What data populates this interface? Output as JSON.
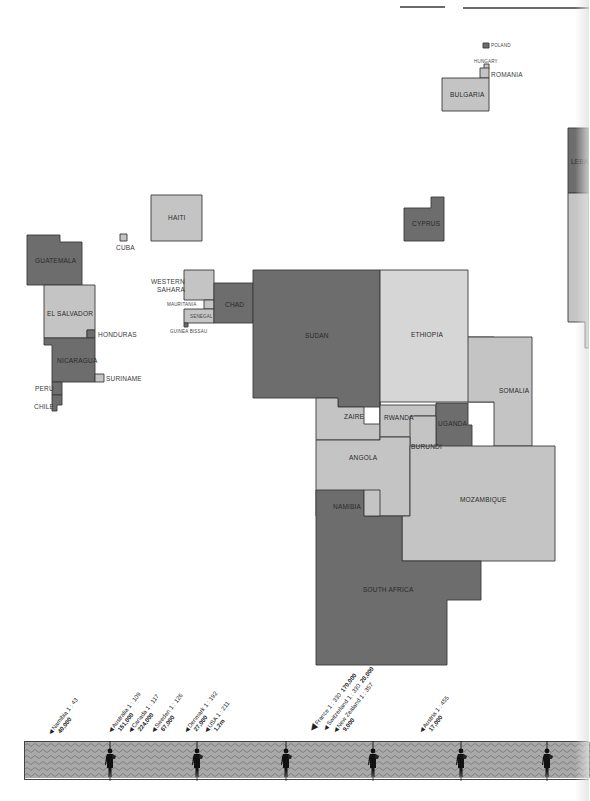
{
  "colors": {
    "dark": "#6d6d6d",
    "light": "#c4c4c4",
    "lighter": "#d6d6d6",
    "outline": "#3a3a3a",
    "band_fill": "#a9a9a9",
    "band_wave": "#7d7d7d"
  },
  "countries": [
    {
      "name": "POLAND",
      "tone": "dark",
      "points": "483,43 489,43 489,48 483,48"
    },
    {
      "name": "HUNGARY",
      "tone": "light",
      "points": "484,64 489,64 489,69 484,69"
    },
    {
      "name": "ROMANIA",
      "tone": "light",
      "points": "480,68 489,68 489,78 480,78"
    },
    {
      "name": "BULGARIA",
      "tone": "light",
      "points": "442,78 489,78 489,111 442,111"
    },
    {
      "name": "LEBANON",
      "tone": "dark",
      "points": "568,128 589,128 589,193 568,193"
    },
    {
      "name": "ISRAEL",
      "tone": "light",
      "points": "568,193 589,193 589,348 585,348 585,322 568,322"
    },
    {
      "name": "CYPRUS",
      "tone": "dark",
      "points": "404,208 431,208 431,197 444,197 444,241 404,241"
    },
    {
      "name": "HAITI",
      "tone": "light",
      "points": "151,195 202,195 202,241 151,241"
    },
    {
      "name": "CUBA",
      "tone": "light",
      "points": "120,234 127,234 127,241 120,241"
    },
    {
      "name": "GUATEMALA",
      "tone": "dark",
      "points": "27,235 60,235 60,242 82,242 82,285 27,285"
    },
    {
      "name": "EL SALVADOR",
      "tone": "light",
      "points": "44,285 95,285 95,330 87,330 87,338 44,338"
    },
    {
      "name": "HONDURAS",
      "tone": "dark",
      "points": "87,330 95,330 95,338 87,338"
    },
    {
      "name": "NICARAGUA",
      "tone": "dark",
      "points": "44,338 95,338 95,382 52,382 52,345 44,345"
    },
    {
      "name": "SURINAME",
      "tone": "light",
      "points": "95,374 104,374 104,382 95,382"
    },
    {
      "name": "PERU",
      "tone": "dark",
      "points": "52,382 62,382 62,395 52,395"
    },
    {
      "name": "CHILE",
      "tone": "dark",
      "points": "52,395 62,395 62,405 57,405 57,411 52,411"
    },
    {
      "name": "WESTERN SAHARA",
      "tone": "light",
      "points": "184,270 214,270 214,300 184,300"
    },
    {
      "name": "MAURITANIA",
      "tone": "light",
      "points": "204,300 214,300 214,309 204,309"
    },
    {
      "name": "SENEGAL",
      "tone": "light",
      "points": "184,309 214,309 214,323 184,323"
    },
    {
      "name": "GUINEA BISSAU",
      "tone": "dark",
      "points": "184,323 188,323 188,327 184,327"
    },
    {
      "name": "CHAD",
      "tone": "dark",
      "points": "214,283 253,283 253,323 214,323"
    },
    {
      "name": "SUDAN",
      "tone": "dark",
      "points": "253,270 380,270 380,407 338,407 338,398 253,398"
    },
    {
      "name": "ETHIOPIA",
      "tone": "lighter",
      "points": "380,270 468,270 468,337 494,337 494,402 380,402"
    },
    {
      "name": "SOMALIA",
      "tone": "light",
      "points": "468,337 532,337 532,446 494,446 494,402 468,402"
    },
    {
      "name": "ZAIRE",
      "tone": "light",
      "points": "316,398 338,398 338,407 364,407 364,424 380,424 380,402 380,440 316,440"
    },
    {
      "name": "RWANDA",
      "tone": "light",
      "points": "380,405 436,405 436,416 414,416 414,437 380,437"
    },
    {
      "name": "UGANDA",
      "tone": "dark",
      "points": "436,403 468,403 468,425 472,425 472,447 436,447"
    },
    {
      "name": "BURUNDI",
      "tone": "light",
      "points": "410,416 436,416 436,460 410,460"
    },
    {
      "name": "ANGOLA",
      "tone": "light",
      "points": "316,440 380,440 380,437 410,437 410,516 316,516"
    },
    {
      "name": "MOZAMBIQUE",
      "tone": "light",
      "points": "410,446 555,446 555,561 402,561 402,516 410,516"
    },
    {
      "name": "NAMIBIA",
      "tone": "dark",
      "points": "316,490 364,490 364,516 392,516 392,516 402,516 402,561 481,561 481,600 447,600 447,665 316,665"
    },
    {
      "name": "NAMIBIA_INSET",
      "tone": "light",
      "points": "364,490 380,490 380,516 364,516"
    }
  ],
  "labels": [
    {
      "text": "POLAND",
      "x": 491,
      "y": 43,
      "cls": "tiny"
    },
    {
      "text": "HUNGARY",
      "x": 474,
      "y": 59,
      "cls": "tiny"
    },
    {
      "text": "ROMANIA",
      "x": 491,
      "y": 71,
      "cls": "out"
    },
    {
      "text": "BULGARIA",
      "x": 450,
      "y": 91,
      "cls": "in"
    },
    {
      "text": "LEBA",
      "x": 571,
      "y": 158,
      "cls": "in"
    },
    {
      "text": "CYPRUS",
      "x": 412,
      "y": 220,
      "cls": "in"
    },
    {
      "text": "HAITI",
      "x": 168,
      "y": 214,
      "cls": "in"
    },
    {
      "text": "CUBA",
      "x": 116,
      "y": 244,
      "cls": "out"
    },
    {
      "text": "GUATEMALA",
      "x": 35,
      "y": 257,
      "cls": "in"
    },
    {
      "text": "EL SALVADOR",
      "x": 47,
      "y": 310,
      "cls": "in"
    },
    {
      "text": "HONDURAS",
      "x": 98,
      "y": 331,
      "cls": "out"
    },
    {
      "text": "NICARAGUA",
      "x": 57,
      "y": 357,
      "cls": "in"
    },
    {
      "text": "SURINAME",
      "x": 106,
      "y": 375,
      "cls": "out"
    },
    {
      "text": "PERU",
      "x": 35,
      "y": 385,
      "cls": "out"
    },
    {
      "text": "CHILE",
      "x": 34,
      "y": 403,
      "cls": "out"
    },
    {
      "text": "WESTERN",
      "x": 151,
      "y": 278,
      "cls": "out"
    },
    {
      "text": "SAHARA",
      "x": 157,
      "y": 286,
      "cls": "out"
    },
    {
      "text": "MAURITANIA",
      "x": 167,
      "y": 302,
      "cls": "tiny"
    },
    {
      "text": "SENEGAL",
      "x": 190,
      "y": 314,
      "cls": "tiny"
    },
    {
      "text": "GUINEA BISSAU",
      "x": 170,
      "y": 329,
      "cls": "tiny"
    },
    {
      "text": "CHAD",
      "x": 225,
      "y": 301,
      "cls": "in"
    },
    {
      "text": "SUDAN",
      "x": 305,
      "y": 332,
      "cls": "in"
    },
    {
      "text": "ETHIOPIA",
      "x": 411,
      "y": 331,
      "cls": "in"
    },
    {
      "text": "SOMALIA",
      "x": 499,
      "y": 387,
      "cls": "in"
    },
    {
      "text": "ZAIRE",
      "x": 344,
      "y": 413,
      "cls": "in"
    },
    {
      "text": "RWANDA",
      "x": 384,
      "y": 414,
      "cls": "in"
    },
    {
      "text": "UGANDA",
      "x": 438,
      "y": 420,
      "cls": "in"
    },
    {
      "text": "BURUNDI",
      "x": 411,
      "y": 443,
      "cls": "in"
    },
    {
      "text": "ANGOLA",
      "x": 349,
      "y": 454,
      "cls": "in"
    },
    {
      "text": "NAMIBIA",
      "x": 333,
      "y": 503,
      "cls": "in"
    },
    {
      "text": "MOZAMBIQUE",
      "x": 460,
      "y": 496,
      "cls": "in"
    },
    {
      "text": "SOUTH AFRICA",
      "x": 363,
      "y": 586,
      "cls": "in"
    }
  ],
  "scale_annotations": [
    {
      "country": "Namibia",
      "ratio": "1 : 43",
      "value": "40,000",
      "x": 57,
      "y": 740,
      "big": false
    },
    {
      "country": "Australia",
      "ratio": "1 : 109",
      "value": "151,000",
      "x": 117,
      "y": 738,
      "big": false
    },
    {
      "country": "Canada",
      "ratio": "1 : 117",
      "value": "224,000",
      "x": 137,
      "y": 738,
      "big": false
    },
    {
      "country": "Sweden",
      "ratio": "1 : 126",
      "value": "67,000",
      "x": 160,
      "y": 738,
      "big": false
    },
    {
      "country": "Denmark",
      "ratio": "1 : 192",
      "value": "27,000",
      "x": 193,
      "y": 738,
      "big": false
    },
    {
      "country": "USA",
      "ratio": "1 : 211",
      "value": "1.2m",
      "x": 213,
      "y": 738,
      "big": false
    },
    {
      "country": "France",
      "ratio": "1 : 330",
      "value": "170,000",
      "x": 314,
      "y": 738,
      "big": true,
      "inline": true
    },
    {
      "country": "Switzerland",
      "ratio": "1 : 330",
      "value": "20,000",
      "x": 327,
      "y": 738,
      "big": false,
      "inline": true
    },
    {
      "country": "New Zealand",
      "ratio": "1 : 357",
      "value": "9,000",
      "x": 342,
      "y": 738,
      "big": false
    },
    {
      "country": "Austria",
      "ratio": "1 : 455",
      "value": "17,000",
      "x": 428,
      "y": 738,
      "big": false
    }
  ],
  "band": {
    "figures_x": [
      110,
      197,
      286,
      373,
      461,
      547
    ]
  }
}
